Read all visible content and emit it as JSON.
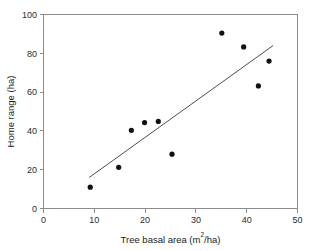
{
  "chart_data": {
    "type": "scatter",
    "title": "",
    "xlabel": "Tree basal area (m2/ha)",
    "xlabel_base": "Tree basal area (m",
    "xlabel_sup": "2",
    "xlabel_tail": "/ha)",
    "ylabel": "Home range (ha)",
    "xlim": [
      0,
      50
    ],
    "ylim": [
      0,
      100
    ],
    "xticks": [
      0,
      10,
      20,
      30,
      40,
      50
    ],
    "yticks": [
      0,
      20,
      40,
      60,
      80,
      100
    ],
    "grid": false,
    "legend": "none",
    "point_color": "#111111",
    "line_color": "#4d4d4d",
    "axis_color": "#8c8c8c",
    "points": [
      {
        "x": 9.2,
        "y": 11.0
      },
      {
        "x": 14.8,
        "y": 21.2
      },
      {
        "x": 17.3,
        "y": 40.3
      },
      {
        "x": 19.9,
        "y": 44.3
      },
      {
        "x": 22.6,
        "y": 44.9
      },
      {
        "x": 25.3,
        "y": 28.0
      },
      {
        "x": 35.1,
        "y": 90.4
      },
      {
        "x": 39.4,
        "y": 83.3
      },
      {
        "x": 42.3,
        "y": 63.2
      },
      {
        "x": 44.4,
        "y": 76.0
      }
    ],
    "fit_line": {
      "x1": 9.0,
      "y1": 16.0,
      "x2": 45.2,
      "y2": 84.0
    }
  }
}
